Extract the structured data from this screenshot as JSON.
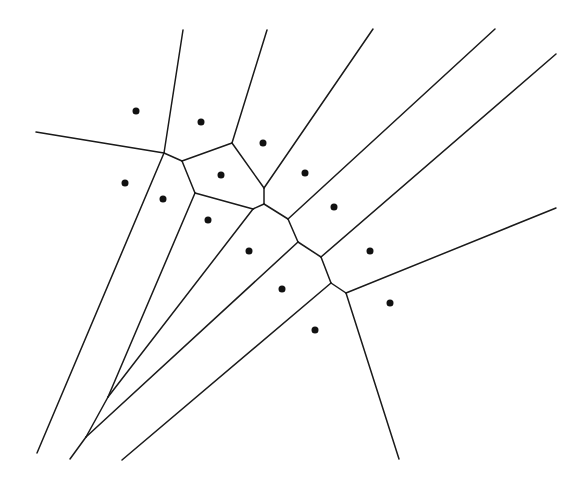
{
  "diagram": {
    "type": "voronoi",
    "colors": {
      "edge": "#1a1a1a",
      "site": "#111111",
      "background": "#ffffff"
    },
    "sites": [
      [
        136,
        111
      ],
      [
        201,
        122
      ],
      [
        263,
        143
      ],
      [
        125,
        183
      ],
      [
        163,
        199
      ],
      [
        221,
        175
      ],
      [
        208,
        220
      ],
      [
        305,
        173
      ],
      [
        334,
        207
      ],
      [
        249,
        251
      ],
      [
        370,
        251
      ],
      [
        282,
        289
      ],
      [
        390,
        303
      ],
      [
        315,
        330
      ]
    ],
    "edges": [
      [
        [
          36,
          132
        ],
        [
          164,
          153
        ]
      ],
      [
        [
          183,
          30
        ],
        [
          164,
          153
        ]
      ],
      [
        [
          164,
          153
        ],
        [
          182,
          161
        ]
      ],
      [
        [
          164,
          153
        ],
        [
          37,
          453
        ]
      ],
      [
        [
          182,
          161
        ],
        [
          232,
          143
        ]
      ],
      [
        [
          182,
          161
        ],
        [
          195,
          193
        ]
      ],
      [
        [
          267,
          30
        ],
        [
          232,
          143
        ]
      ],
      [
        [
          232,
          143
        ],
        [
          264,
          188
        ]
      ],
      [
        [
          264,
          188
        ],
        [
          264,
          204
        ]
      ],
      [
        [
          264,
          188
        ],
        [
          373,
          29
        ]
      ],
      [
        [
          195,
          193
        ],
        [
          253,
          209
        ]
      ],
      [
        [
          195,
          193
        ],
        [
          108,
          397
        ]
      ],
      [
        [
          253,
          209
        ],
        [
          264,
          204
        ]
      ],
      [
        [
          253,
          209
        ],
        [
          108,
          397
        ]
      ],
      [
        [
          108,
          397
        ],
        [
          86,
          437
        ]
      ],
      [
        [
          264,
          204
        ],
        [
          288,
          219
        ]
      ],
      [
        [
          288,
          219
        ],
        [
          495,
          29
        ]
      ],
      [
        [
          288,
          219
        ],
        [
          298,
          242
        ]
      ],
      [
        [
          298,
          242
        ],
        [
          321,
          257
        ]
      ],
      [
        [
          298,
          242
        ],
        [
          86,
          437
        ]
      ],
      [
        [
          86,
          437
        ],
        [
          70,
          459
        ]
      ],
      [
        [
          321,
          257
        ],
        [
          556,
          54
        ]
      ],
      [
        [
          321,
          257
        ],
        [
          331,
          283
        ]
      ],
      [
        [
          331,
          283
        ],
        [
          346,
          293
        ]
      ],
      [
        [
          331,
          283
        ],
        [
          122,
          460
        ]
      ],
      [
        [
          346,
          293
        ],
        [
          556,
          208
        ]
      ],
      [
        [
          346,
          293
        ],
        [
          399,
          459
        ]
      ]
    ]
  }
}
